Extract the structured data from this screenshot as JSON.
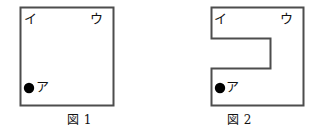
{
  "figures": [
    {
      "id": "figure-1",
      "caption": "図 1",
      "shape": "square",
      "vertex_labels": {
        "top_left": "イ",
        "top_right": "ウ",
        "bottom_left_marker": "ア"
      },
      "marker": "filled-circle",
      "outline_color": "#4d4d4d",
      "fill_color": "#ffffff",
      "marker_color": "#000000"
    },
    {
      "id": "figure-2",
      "caption": "図 2",
      "shape": "c-shaped-polygon",
      "vertex_labels": {
        "top_left": "イ",
        "top_right": "ウ",
        "bottom_left_marker": "ア"
      },
      "marker": "filled-circle",
      "outline_color": "#4d4d4d",
      "fill_color": "#ffffff",
      "marker_color": "#000000"
    }
  ]
}
